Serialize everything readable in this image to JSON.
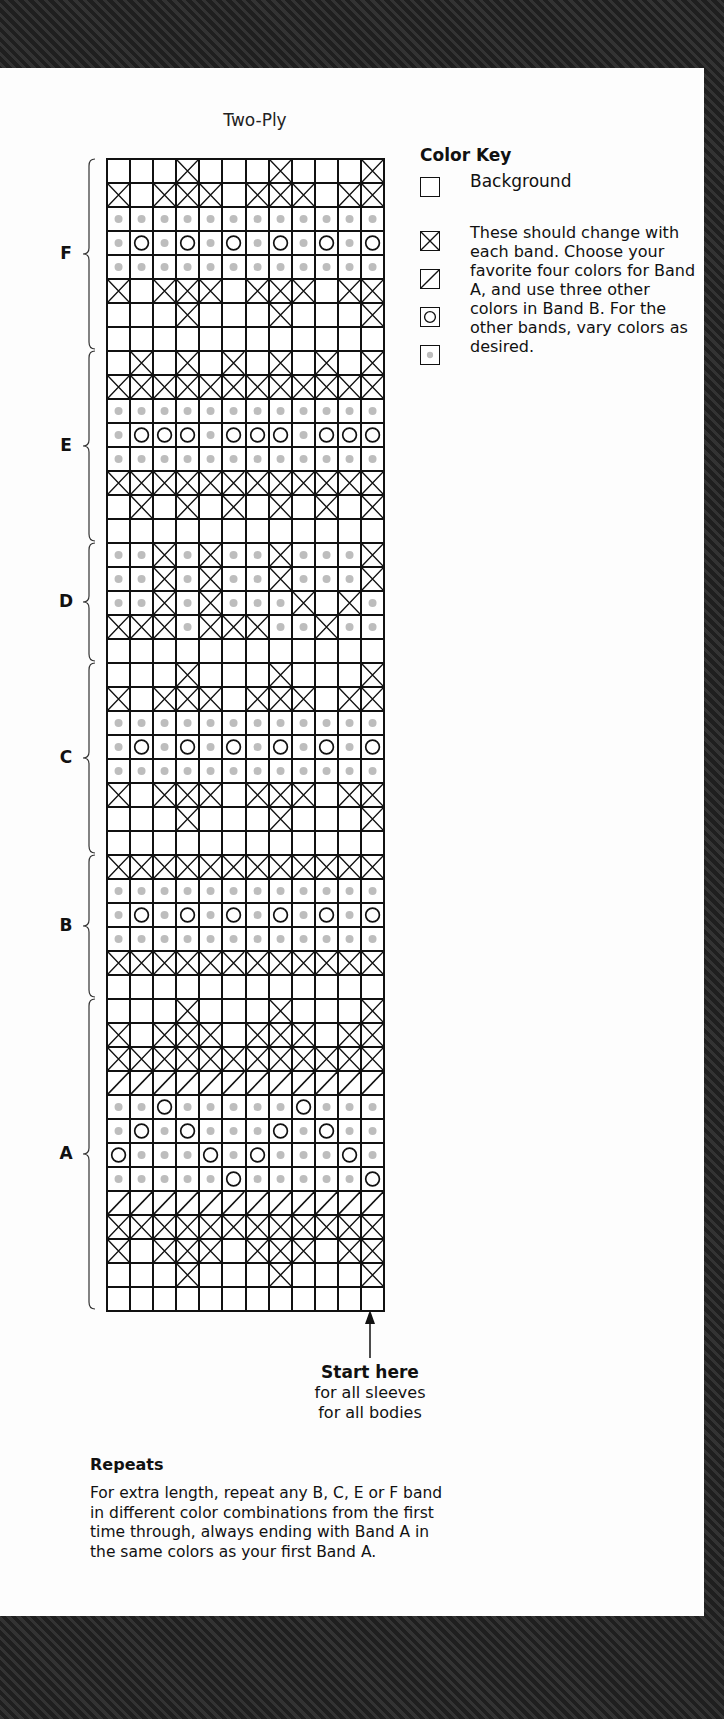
{
  "title": "Two-Ply",
  "legend": {
    "heading": "Color Key",
    "background_label": "Background",
    "description": "These should change with each band. Choose your favorite four colors for Band A, and use three other colors in Band B. For the other bands, vary colors as desired.",
    "symbols": [
      {
        "symbol": "blank",
        "meaning": "Background"
      },
      {
        "symbol": "x-box",
        "meaning": "contrast color 1"
      },
      {
        "symbol": "slash-box",
        "meaning": "contrast color 2"
      },
      {
        "symbol": "circle-box",
        "meaning": "contrast color 3"
      },
      {
        "symbol": "dot-box",
        "meaning": "contrast color 4"
      }
    ],
    "colors": {
      "dot": "#bdbdbd",
      "line": "#111111",
      "background": "#ffffff"
    }
  },
  "start": {
    "heading": "Start here",
    "line1": "for all sleeves",
    "line2": "for all bodies"
  },
  "repeats": {
    "heading": "Repeats",
    "text": "For extra length, repeat any B, C, E or F band in different color combinations from the first time through, always ending with Band A in the same colors as your first Band A."
  },
  "chart_data": {
    "type": "table",
    "title": "Two-Ply",
    "columns": 12,
    "legend_codes": {
      "_": "background",
      "X": "x-box",
      "/": "slash-box",
      "O": "circle-box",
      ".": "dot-box"
    },
    "bands": [
      {
        "label": "F",
        "rows": [
          "___X___X___X",
          "X_XXX_XXX_XX",
          "............",
          ".O.O.O.O.O.O",
          "............",
          "X_XXX_XXX_XX",
          "___X___X___X",
          "____________"
        ]
      },
      {
        "label": "E",
        "rows": [
          "_X_X_X_X_X_X",
          "XXXXXXXXXXXX",
          "............",
          ".OOO.OOO.OOO",
          "............",
          "XXXXXXXXXXXX",
          "_X_X_X_X_X_X",
          "____________"
        ]
      },
      {
        "label": "D",
        "rows": [
          "..X.X..X...X",
          "..X.X..X...X",
          "..X.X...X_X.",
          "XXX.XXX..X..",
          "____________"
        ]
      },
      {
        "label": "C",
        "rows": [
          "___X___X___X",
          "X_XXX_XXX_XX",
          "............",
          ".O.O.O.O.O.O",
          "............",
          "X_XXX_XXX_XX",
          "___X___X___X",
          "____________"
        ]
      },
      {
        "label": "B",
        "rows": [
          "XXXXXXXXXXXX",
          "............",
          ".O.O.O.O.O.O",
          "............",
          "XXXXXXXXXXXX",
          "____________"
        ]
      },
      {
        "label": "A",
        "rows": [
          "___X___X___X",
          "X_XXX_XXX_XX",
          "XXXXXXXXXXXX",
          "////////////",
          "..O.....O...",
          ".O.O...O.O..",
          "O...O.O...O.",
          ".....O.....O",
          "////////////",
          "XXXXXXXXXXXX",
          "X_XXX_XXX_XX",
          "___X___X___X",
          "____________"
        ]
      }
    ]
  }
}
